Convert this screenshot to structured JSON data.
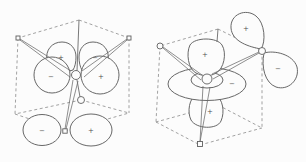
{
  "diagram": {
    "left_panel": {
      "signs": {
        "upper_left_lobe": "+",
        "upper_right_lobe": "−",
        "front_left_lobe": "−",
        "front_right_lobe": "+",
        "bottom_left_lobe": "−",
        "bottom_right_lobe": "+"
      }
    },
    "right_panel": {
      "signs": {
        "top_lobe": "+",
        "torus_ring": "−",
        "bottom_lobe": "+",
        "corner_upper_lobe": "+",
        "corner_lower_lobe": "−"
      }
    },
    "colors": {
      "line": "#6a6a6a",
      "dashed_line": "#8a8a8a",
      "background": "#fcfcfc"
    }
  }
}
